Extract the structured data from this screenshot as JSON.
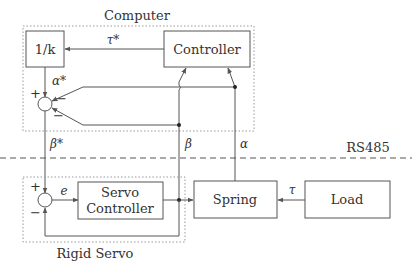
{
  "diagram": {
    "groups": {
      "computer": {
        "label": "Computer"
      },
      "rigid_servo": {
        "label": "Rigid Servo"
      }
    },
    "blocks": {
      "inv_k": {
        "label": "1/k"
      },
      "controller": {
        "label": "Controller"
      },
      "servo_controller": {
        "line1": "Servo",
        "line2": "Controller"
      },
      "spring": {
        "label": "Spring"
      },
      "load": {
        "label": "Load"
      }
    },
    "signals": {
      "tau_star": "τ*",
      "alpha_star": "α*",
      "beta_star": "β*",
      "beta": "β",
      "alpha": "α",
      "error": "e",
      "tau": "τ"
    },
    "summing_junctions": {
      "top": {
        "plus": "+",
        "minus_upper": "−",
        "minus_lower": "−"
      },
      "bottom": {
        "plus": "+",
        "minus": "−"
      }
    },
    "bus": {
      "label": "RS485"
    },
    "colors": {
      "line": "#555555",
      "box_border": "#555555",
      "dotted_border": "#999999",
      "text": "#333333"
    }
  }
}
